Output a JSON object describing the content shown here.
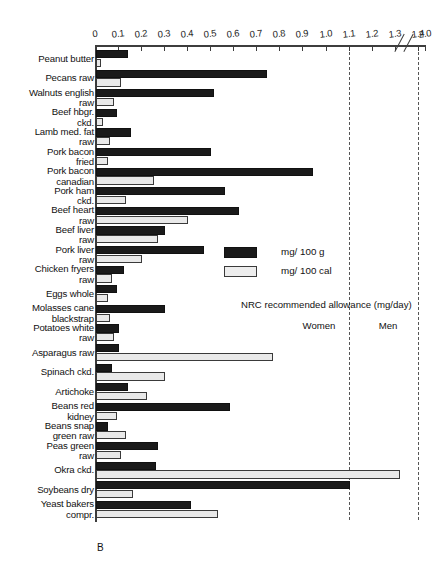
{
  "chart_data": {
    "type": "bar",
    "orientation": "horizontal",
    "title": "",
    "xlabel": "",
    "ylabel": "",
    "xlim": [
      0,
      1.5
    ],
    "axis_break": {
      "after": 1.4,
      "resumes_at": 2.0
    },
    "grid": false,
    "tick_labels": [
      "0",
      "0.1",
      "0.2",
      "0.3",
      "0.4",
      "0.5",
      "0.6",
      "0.7",
      "0.8",
      "0.9",
      "1.0",
      "1.1",
      "1.2",
      "1.3",
      "1.4",
      "2.0"
    ],
    "tick_values": [
      0,
      0.1,
      0.2,
      0.3,
      0.4,
      0.5,
      0.6,
      0.7,
      0.8,
      0.9,
      1.0,
      1.1,
      1.2,
      1.3,
      1.4,
      2.0
    ],
    "legend_position": "center-right",
    "panel_letter": "B",
    "categories": [
      "Peanut butter",
      "Pecans raw",
      "Walnuts english\nraw",
      "Beef hbgr.\nckd.",
      "Lamb med. fat\nraw",
      "Pork bacon\nfried",
      "Pork bacon\ncanadian",
      "Pork ham\nckd.",
      "Beef heart\nraw",
      "Beef liver\nraw",
      "Pork liver\nraw",
      "Chicken fryers\nraw",
      "Eggs whole",
      "Molasses cane\nblackstrap",
      "Potatoes white\nraw",
      "Asparagus raw",
      "Spinach ckd.",
      "Artichoke",
      "Beans red\nkidney",
      "Beans snap\ngreen raw",
      "Peas green\nraw",
      "Okra ckd.",
      "Soybeans dry",
      "Yeast bakers\ncompr."
    ],
    "series": [
      {
        "name": "mg/ 100 g",
        "color": "#1a1a1a",
        "values": [
          0.14,
          0.74,
          0.51,
          0.09,
          0.15,
          0.5,
          0.94,
          0.56,
          0.62,
          0.3,
          0.47,
          0.12,
          0.09,
          0.3,
          0.1,
          0.1,
          0.07,
          0.14,
          0.58,
          0.05,
          0.27,
          0.26,
          1.1,
          0.41
        ]
      },
      {
        "name": "mg/ 100 cal",
        "color": "#e9e9e9",
        "values": [
          0.02,
          0.11,
          0.08,
          0.03,
          0.06,
          0.05,
          0.25,
          0.13,
          0.4,
          0.27,
          0.2,
          0.07,
          0.05,
          0.06,
          0.08,
          0.77,
          0.3,
          0.22,
          0.09,
          0.13,
          0.11,
          1.32,
          0.16,
          0.53
        ]
      }
    ],
    "reference_lines": [
      {
        "label": "Women",
        "value": 1.1
      },
      {
        "label": "Men",
        "value": 1.4
      },
      {
        "caption": "NRC recommended allowance (mg/day)"
      }
    ]
  }
}
